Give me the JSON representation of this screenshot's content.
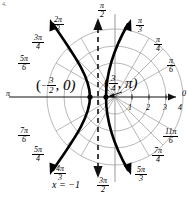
{
  "figure": {
    "type": "polar-graph",
    "corner_mark": "4."
  },
  "axis_labels": {
    "pi_left": "π",
    "right_edge": "0"
  },
  "angle_labels": [
    {
      "name": "angle-pi-over-2",
      "num": "π",
      "den": "2",
      "x": 98,
      "y": 2
    },
    {
      "name": "angle-pi-over-3",
      "num": "π",
      "den": "3",
      "x": 136,
      "y": 17
    },
    {
      "name": "angle-pi-over-4",
      "num": "π",
      "den": "4",
      "x": 154,
      "y": 36
    },
    {
      "name": "angle-pi-over-6",
      "num": "π",
      "den": "6",
      "x": 167,
      "y": 57
    },
    {
      "name": "angle-2pi-over-3",
      "num": "2π",
      "den": "3",
      "x": 52,
      "y": 16
    },
    {
      "name": "angle-3pi-over-4",
      "num": "3π",
      "den": "4",
      "x": 32,
      "y": 34
    },
    {
      "name": "angle-5pi-over-6",
      "num": "5π",
      "den": "6",
      "x": 18,
      "y": 55
    },
    {
      "name": "angle-7pi-over-6",
      "num": "7π",
      "den": "6",
      "x": 18,
      "y": 127
    },
    {
      "name": "angle-5pi-over-4",
      "num": "5π",
      "den": "4",
      "x": 32,
      "y": 146
    },
    {
      "name": "angle-4pi-over-3",
      "num": "4π",
      "den": "3",
      "x": 54,
      "y": 165
    },
    {
      "name": "angle-3pi-over-2",
      "num": "3π",
      "den": "2",
      "x": 97,
      "y": 177
    },
    {
      "name": "angle-5pi-over-3",
      "num": "5π",
      "den": "3",
      "x": 135,
      "y": 166
    },
    {
      "name": "angle-7pi-over-4",
      "num": "7π",
      "den": "4",
      "x": 152,
      "y": 147
    },
    {
      "name": "angle-11pi-over-6",
      "num": "11π",
      "den": "6",
      "x": 163,
      "y": 128
    }
  ],
  "radial_ticks": [
    {
      "name": "tick-1",
      "label": "1",
      "x": 128,
      "y": 104
    },
    {
      "name": "tick-2",
      "label": "2",
      "x": 146,
      "y": 104
    },
    {
      "name": "tick-3",
      "label": "3",
      "x": 163,
      "y": 104
    },
    {
      "name": "tick-4",
      "label": "4",
      "x": 178,
      "y": 104
    }
  ],
  "point_labels": {
    "left_vertex": {
      "open": "(",
      "sign": "−",
      "num": "3",
      "den": "2",
      "rest": ", 0)",
      "x": 36,
      "y": 76
    },
    "right_vertex": {
      "open": "(",
      "num": "3",
      "den": "4",
      "rest": ", π)",
      "x": 104,
      "y": 74
    }
  },
  "asymptote": {
    "name": "asymptote-x-equals-minus-1",
    "label": "x = −1",
    "x": 52,
    "y": 180
  },
  "chart_data": {
    "type": "line",
    "title": "",
    "coordinate_system": "polar",
    "grid": true,
    "radial_range": [
      0,
      4.5
    ],
    "radial_ticks": [
      1,
      2,
      3,
      4
    ],
    "angular_ticks": [
      "0",
      "π/6",
      "π/4",
      "π/3",
      "π/2",
      "2π/3",
      "3π/4",
      "5π/6",
      "π",
      "7π/6",
      "5π/4",
      "4π/3",
      "3π/2",
      "5π/3",
      "7π/4",
      "11π/6"
    ],
    "curves": [
      {
        "name": "hyperbola-left-branch",
        "description": "left branch opening leftward through vertex (-3/2, 0)"
      },
      {
        "name": "hyperbola-right-branch",
        "description": "right branch opening rightward through vertex (3/4, pi)"
      }
    ],
    "asymptotes": [
      {
        "name": "vertical-asymptote",
        "equation": "x = -1",
        "style": "dashed"
      }
    ],
    "annotated_points": [
      {
        "label": "(-3/2, 0)",
        "r": -1.5,
        "theta": "0"
      },
      {
        "label": "(3/4, π)",
        "r": 0.75,
        "theta": "π"
      }
    ]
  }
}
